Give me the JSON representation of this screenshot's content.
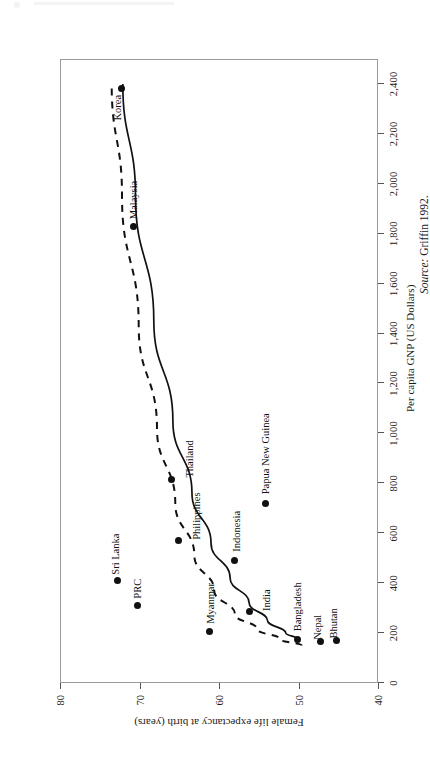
{
  "figure": {
    "source_note_prefix": "Source:",
    "source_note_text": " Griffin 1992."
  },
  "chart_data": {
    "type": "scatter",
    "title": "",
    "xlabel": "Per capita GNP  (US Dollars)",
    "ylabel": "Female life expectancy at birth  (years)",
    "xlim": [
      0,
      2500
    ],
    "ylim": [
      40,
      80
    ],
    "grid": false,
    "legend": "none",
    "xticks": [
      0,
      200,
      400,
      600,
      800,
      1000,
      1200,
      1400,
      1600,
      1800,
      2000,
      2200,
      2400
    ],
    "xticklabels": [
      "0",
      "200",
      "400",
      "600",
      "800",
      "1,000",
      "1,200",
      "1,400",
      "1,600",
      "1,800",
      "2,000",
      "2,200",
      "2,400"
    ],
    "yticks": [
      40,
      50,
      60,
      70,
      80
    ],
    "yticklabels": [
      "40",
      "50",
      "60",
      "70",
      "80"
    ],
    "points": [
      {
        "label": "Korea",
        "x": 2380,
        "y": 72.3
      },
      {
        "label": "Malaysia",
        "x": 1830,
        "y": 70.8
      },
      {
        "label": "Thailand",
        "x": 815,
        "y": 66.0
      },
      {
        "label": "Papua New Guinea",
        "x": 720,
        "y": 54.2
      },
      {
        "label": "Philippines",
        "x": 570,
        "y": 65.1
      },
      {
        "label": "Indonesia",
        "x": 490,
        "y": 58.0
      },
      {
        "label": "Sri Lanka",
        "x": 410,
        "y": 72.8
      },
      {
        "label": "PRC",
        "x": 310,
        "y": 70.3
      },
      {
        "label": "India",
        "x": 285,
        "y": 56.2
      },
      {
        "label": "Myanmar",
        "x": 205,
        "y": 61.2
      },
      {
        "label": "Bangladesh",
        "x": 175,
        "y": 50.1
      },
      {
        "label": "Nepal",
        "x": 165,
        "y": 47.2
      },
      {
        "label": "Bhutan",
        "x": 170,
        "y": 45.2
      }
    ],
    "curves": [
      {
        "name": "fitted-curve-solid",
        "style": "solid",
        "points": [
          [
            175,
            50.0
          ],
          [
            200,
            51.6
          ],
          [
            250,
            53.9
          ],
          [
            320,
            56.2
          ],
          [
            420,
            58.6
          ],
          [
            560,
            61.0
          ],
          [
            760,
            63.4
          ],
          [
            1050,
            65.8
          ],
          [
            1450,
            68.2
          ],
          [
            1950,
            70.5
          ],
          [
            2400,
            72.1
          ]
        ]
      },
      {
        "name": "fitted-curve-dashed",
        "style": "dashed",
        "points": [
          [
            150,
            49.6
          ],
          [
            175,
            52.3
          ],
          [
            215,
            55.2
          ],
          [
            275,
            58.0
          ],
          [
            370,
            60.6
          ],
          [
            510,
            63.1
          ],
          [
            720,
            65.5
          ],
          [
            1020,
            67.8
          ],
          [
            1430,
            70.1
          ],
          [
            1950,
            72.2
          ],
          [
            2400,
            73.5
          ]
        ]
      }
    ]
  }
}
